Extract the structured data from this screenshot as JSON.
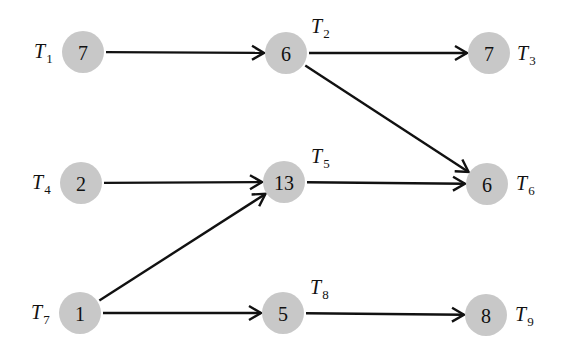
{
  "diagram": {
    "type": "task-dependency-graph",
    "nodes": [
      {
        "id": "T1",
        "label_main": "T",
        "label_sub": "1",
        "weight": "7",
        "x": 83,
        "y": 52,
        "lx": 34,
        "ly": 58
      },
      {
        "id": "T2",
        "label_main": "T",
        "label_sub": "2",
        "weight": "6",
        "x": 286,
        "y": 53,
        "lx": 311,
        "ly": 33
      },
      {
        "id": "T3",
        "label_main": "T",
        "label_sub": "3",
        "weight": "7",
        "x": 489,
        "y": 53,
        "lx": 517,
        "ly": 60
      },
      {
        "id": "T4",
        "label_main": "T",
        "label_sub": "4",
        "weight": "2",
        "x": 81,
        "y": 183,
        "lx": 32,
        "ly": 189
      },
      {
        "id": "T5",
        "label_main": "T",
        "label_sub": "5",
        "weight": "13",
        "x": 284,
        "y": 182,
        "lx": 311,
        "ly": 163
      },
      {
        "id": "T6",
        "label_main": "T",
        "label_sub": "6",
        "weight": "6",
        "x": 487,
        "y": 184,
        "lx": 516,
        "ly": 190
      },
      {
        "id": "T7",
        "label_main": "T",
        "label_sub": "7",
        "weight": "1",
        "x": 80,
        "y": 313,
        "lx": 31,
        "ly": 319
      },
      {
        "id": "T8",
        "label_main": "T",
        "label_sub": "8",
        "weight": "5",
        "x": 283,
        "y": 313,
        "lx": 310,
        "ly": 294
      },
      {
        "id": "T9",
        "label_main": "T",
        "label_sub": "9",
        "weight": "8",
        "x": 486,
        "y": 315,
        "lx": 515,
        "ly": 321
      }
    ],
    "edges": [
      {
        "from": "T1",
        "to": "T2"
      },
      {
        "from": "T2",
        "to": "T3"
      },
      {
        "from": "T2",
        "to": "T6"
      },
      {
        "from": "T4",
        "to": "T5"
      },
      {
        "from": "T5",
        "to": "T6"
      },
      {
        "from": "T7",
        "to": "T5"
      },
      {
        "from": "T7",
        "to": "T8"
      },
      {
        "from": "T8",
        "to": "T9"
      }
    ],
    "colors": {
      "node_fill": "#c8c8c8",
      "edge": "#111111",
      "text": "#111111"
    }
  }
}
